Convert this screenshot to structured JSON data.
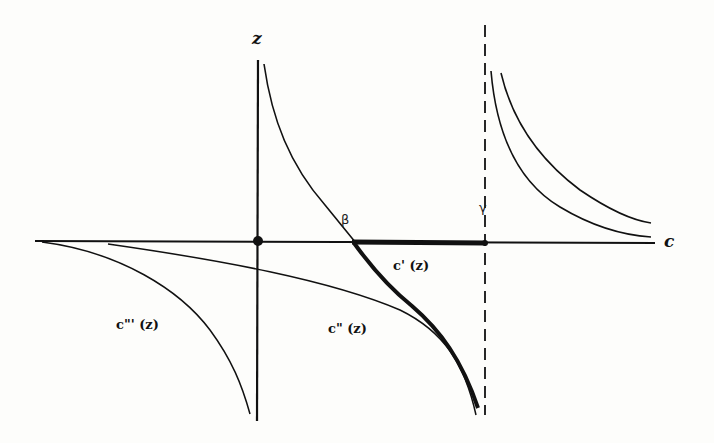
{
  "diagram": {
    "axes": {
      "vertical_label": "z",
      "horizontal_label": "c"
    },
    "points": {
      "beta": "β",
      "gamma": "γ"
    },
    "curves": {
      "c_prime": "c' (z)",
      "c_double_prime": "c\" (z)",
      "c_triple_prime": "c\"' (z)"
    },
    "colors": {
      "ink": "#111111",
      "background": "#fdfdfb"
    }
  }
}
